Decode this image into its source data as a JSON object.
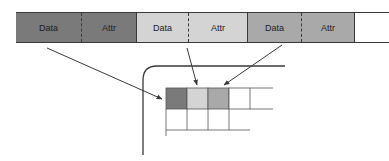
{
  "diagram": {
    "strip": {
      "cells": [
        {
          "label": "Data",
          "fill": "#7a7a7a"
        },
        {
          "label": "Attr",
          "fill": "#7a7a7a"
        },
        {
          "label": "Data",
          "fill": "#d4d4d4"
        },
        {
          "label": "Attr",
          "fill": "#d4d4d4"
        },
        {
          "label": "Data",
          "fill": "#a9a9a9"
        },
        {
          "label": "Attr",
          "fill": "#a9a9a9"
        },
        {
          "label": "",
          "fill": "#ffffff"
        }
      ]
    },
    "grid": {
      "row1_fills": [
        "#7a7a7a",
        "#d4d4d4",
        "#a9a9a9",
        "#ffffff",
        "#ffffff"
      ]
    },
    "colors": {
      "dark": "#7a7a7a",
      "light": "#d4d4d4",
      "medium": "#a9a9a9",
      "line": "#3a3a3a"
    }
  }
}
